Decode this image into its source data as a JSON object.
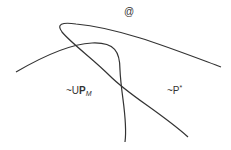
{
  "diagram": {
    "top_symbol": "@",
    "label_left": {
      "prefix": "~U",
      "bold": "P",
      "subscript": "M"
    },
    "label_right": {
      "prefix": "~P",
      "superscript": "*"
    },
    "stroke_color": "#333333",
    "curves": [
      {
        "name": "loop-curve",
        "description": "curve from top-left looping down to bottom-right"
      },
      {
        "name": "arc-curve",
        "description": "curve from left rising then descending to bottom"
      }
    ]
  }
}
